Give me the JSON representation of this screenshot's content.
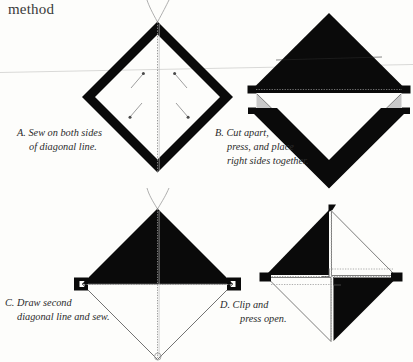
{
  "page": {
    "header": "method",
    "background_color": "#fdfdfb",
    "ink_color": "#000000",
    "caption_color": "#2b2b2b",
    "width": 413,
    "height": 362,
    "scan_artifact_color": "#d8d8d6"
  },
  "panels": [
    {
      "id": "A",
      "label": "A",
      "caption_lines": [
        "A. Sew on both sides",
        "of diagonal line."
      ],
      "caption_full": "A. Sew on both sides of diagonal line.",
      "figure": "diamond-outline-with-stitch-arrows",
      "elements": [
        "thick-black-square-outline-on-point",
        "dotted-vertical-diagonal-line",
        "four-stitch-direction-arrows",
        "needle-and-thread-at-top-point"
      ]
    },
    {
      "id": "B",
      "label": "B",
      "caption_lines": [
        "B. Cut apart,",
        "press, and place",
        "right sides together."
      ],
      "caption_full": "B. Cut apart, press, and place right sides together.",
      "figure": "two-separated-triangles",
      "elements": [
        "upper-solid-black-triangle",
        "lower-black-chevron",
        "dotted-seam-line",
        "gray-seam-allowance-corners",
        "black-ear-tabs"
      ]
    },
    {
      "id": "C",
      "label": "C",
      "caption_lines": [
        "C. Draw second",
        "diagonal line and sew."
      ],
      "caption_full": "C. Draw second diagonal line and sew.",
      "figure": "half-black-half-white-diamond",
      "elements": [
        "upper-solid-black-triangle",
        "lower-white-outlined-triangle",
        "dotted-vertical-line",
        "dotted-horizontal-line",
        "black-ear-tabs",
        "needle-and-thread-at-top-point"
      ]
    },
    {
      "id": "D",
      "label": "D",
      "caption_lines": [
        "D. Clip and",
        "press open."
      ],
      "caption_full": "D. Clip and press open.",
      "figure": "pinwheel-four-quadrant-block",
      "elements": [
        "black-upper-left-quadrant",
        "black-lower-right-quadrant",
        "white-upper-right-quadrant",
        "white-lower-left-quadrant",
        "center-clip-notch",
        "dotted-guide-lines",
        "black-ear-tabs"
      ]
    }
  ]
}
